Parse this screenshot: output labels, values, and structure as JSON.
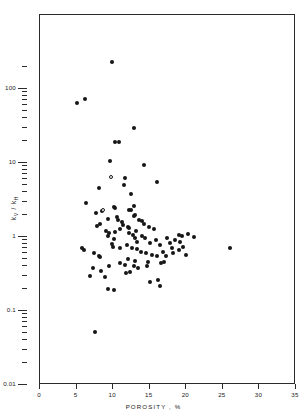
{
  "chart_data": {
    "type": "scatter",
    "title": "",
    "xlabel": "POROSITY , %",
    "ylabel": "k_V / k_H",
    "ylabel_parts": {
      "num_base": "k",
      "num_sub": "V",
      "sep": " / ",
      "den_base": "k",
      "den_sub": "H"
    },
    "xscale": "linear",
    "yscale": "log",
    "xlim": [
      0,
      35
    ],
    "ylim": [
      0.01,
      300
    ],
    "grid": false,
    "legend": null,
    "xticks": [
      0,
      5,
      10,
      15,
      20,
      25,
      30,
      35
    ],
    "xticklabels": [
      "0",
      "5",
      "10",
      "15",
      "20",
      "25",
      "30",
      "35"
    ],
    "ymajorticks": [
      100,
      10,
      1,
      0.1,
      0.01
    ],
    "yticklabels": [
      "100",
      "10",
      "1",
      "0.1",
      "0.01"
    ],
    "yminorticks": [
      200,
      90,
      80,
      70,
      60,
      50,
      40,
      30,
      20,
      9,
      8,
      7,
      6,
      5,
      4,
      3,
      2,
      0.9,
      0.8,
      0.7,
      0.6,
      0.5,
      0.4,
      0.3,
      0.2,
      0.09,
      0.08,
      0.07,
      0.06,
      0.05,
      0.04,
      0.03,
      0.02
    ],
    "marker_styles": [
      {
        "name": "filled-circle",
        "color": "#161616",
        "count": 106
      },
      {
        "name": "open-circle",
        "color": "#ffffff",
        "edge": "#161616",
        "count": 2
      }
    ],
    "n_points": 108,
    "series": [
      {
        "name": "filled",
        "marker": "filled-circle",
        "points": [
          [
            9.8,
            230
          ],
          [
            5.0,
            64
          ],
          [
            6.1,
            74
          ],
          [
            12.9,
            30
          ],
          [
            10.3,
            19.5
          ],
          [
            10.8,
            19.5
          ],
          [
            9.6,
            10.8
          ],
          [
            14.2,
            9.4
          ],
          [
            11.6,
            6.2
          ],
          [
            11.5,
            5.0
          ],
          [
            16.0,
            5.5
          ],
          [
            12.5,
            3.8
          ],
          [
            8.1,
            4.6
          ],
          [
            6.3,
            2.9
          ],
          [
            10.1,
            2.55
          ],
          [
            10.3,
            2.45
          ],
          [
            12.8,
            2.6
          ],
          [
            8.5,
            2.25
          ],
          [
            7.6,
            2.1
          ],
          [
            9.3,
            1.75
          ],
          [
            10.6,
            1.72
          ],
          [
            11.2,
            1.6
          ],
          [
            11.4,
            1.45
          ],
          [
            11.0,
            1.3
          ],
          [
            8.2,
            1.52
          ],
          [
            7.8,
            1.42
          ],
          [
            14.2,
            1.5
          ],
          [
            14.9,
            1.35
          ],
          [
            12.2,
            1.12
          ],
          [
            13.1,
            1.22
          ],
          [
            12.7,
            1.05
          ],
          [
            13.0,
            0.98
          ],
          [
            9.3,
            1.02
          ],
          [
            10.1,
            0.93
          ],
          [
            19.0,
            1.05
          ],
          [
            19.4,
            1.02
          ],
          [
            20.3,
            1.1
          ],
          [
            21.0,
            1.0
          ],
          [
            17.3,
            0.98
          ],
          [
            13.3,
            0.86
          ],
          [
            9.8,
            0.8
          ],
          [
            10.0,
            0.74
          ],
          [
            15.0,
            0.82
          ],
          [
            16.4,
            0.78
          ],
          [
            18.0,
            0.72
          ],
          [
            19.5,
            0.73
          ],
          [
            19.0,
            0.66
          ],
          [
            26.0,
            0.72
          ],
          [
            16.8,
            0.62
          ],
          [
            18.2,
            0.6
          ],
          [
            20.0,
            0.57
          ],
          [
            14.5,
            0.6
          ],
          [
            15.3,
            0.58
          ],
          [
            16.0,
            0.55
          ],
          [
            17.2,
            0.56
          ],
          [
            13.8,
            0.62
          ],
          [
            7.4,
            0.6
          ],
          [
            8.0,
            0.56
          ],
          [
            8.2,
            0.53
          ],
          [
            12.0,
            0.5
          ],
          [
            13.0,
            0.47
          ],
          [
            11.0,
            0.44
          ],
          [
            11.6,
            0.42
          ],
          [
            9.5,
            0.41
          ],
          [
            12.8,
            0.4
          ],
          [
            13.4,
            0.38
          ],
          [
            14.6,
            0.4
          ],
          [
            7.2,
            0.38
          ],
          [
            8.4,
            0.35
          ],
          [
            11.8,
            0.33
          ],
          [
            12.3,
            0.34
          ],
          [
            6.8,
            0.3
          ],
          [
            8.9,
            0.29
          ],
          [
            15.0,
            0.25
          ],
          [
            16.1,
            0.26
          ],
          [
            16.4,
            0.22
          ],
          [
            9.3,
            0.2
          ],
          [
            10.1,
            0.19
          ],
          [
            10.5,
            1.88
          ],
          [
            12.9,
            1.95
          ],
          [
            13.0,
            2.0
          ],
          [
            7.5,
            0.052
          ],
          [
            18.5,
            0.9
          ],
          [
            19.2,
            0.86
          ],
          [
            17.8,
            0.84
          ],
          [
            15.8,
            0.9
          ],
          [
            12.2,
            2.3
          ],
          [
            12.4,
            2.32
          ],
          [
            9.0,
            1.2
          ],
          [
            9.4,
            1.15
          ],
          [
            10.2,
            1.18
          ],
          [
            13.6,
            1.7
          ],
          [
            14.0,
            1.65
          ],
          [
            13.9,
            1.04
          ],
          [
            14.3,
            0.96
          ],
          [
            11.9,
            0.78
          ],
          [
            10.9,
            0.72
          ],
          [
            12.6,
            0.7
          ],
          [
            13.2,
            0.68
          ],
          [
            5.8,
            0.7
          ],
          [
            6.0,
            0.66
          ],
          [
            12.0,
            1.38
          ],
          [
            12.1,
            1.33
          ],
          [
            15.6,
            1.3
          ],
          [
            16.5,
            0.44
          ],
          [
            17.0,
            0.46
          ],
          [
            14.8,
            0.46
          ]
        ]
      },
      {
        "name": "open",
        "marker": "open-circle",
        "points": [
          [
            9.7,
            6.4
          ],
          [
            8.6,
            2.3
          ]
        ]
      }
    ]
  },
  "axes": {
    "y_title_html": "k",
    "y_sub_1": "V",
    "y_mid": " / ",
    "y_den": "k",
    "y_sub_2": "H",
    "x_title": "POROSITY , %"
  }
}
